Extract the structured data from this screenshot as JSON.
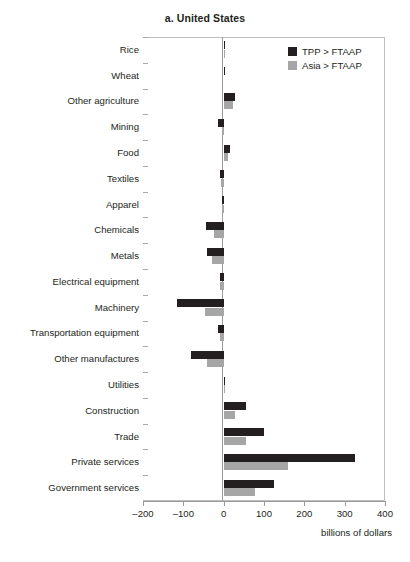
{
  "chart_data": {
    "type": "bar",
    "orientation": "horizontal",
    "title": "a. United States",
    "xlabel": "billions of dollars",
    "ylabel": "",
    "xlim": [
      -200,
      400
    ],
    "xticks": [
      -200,
      -100,
      0,
      100,
      200,
      300,
      400
    ],
    "xtick_labels": [
      "–200",
      "–100",
      "0",
      "100",
      "200",
      "300",
      "400"
    ],
    "grid": false,
    "legend_position": "top-right",
    "categories": [
      "Rice",
      "Wheat",
      "Other agriculture",
      "Mining",
      "Food",
      "Textiles",
      "Apparel",
      "Chemicals",
      "Metals",
      "Electrical equipment",
      "Machinery",
      "Transportation equipment",
      "Other manufactures",
      "Utilities",
      "Construction",
      "Trade",
      "Private services",
      "Government services"
    ],
    "series": [
      {
        "name": "TPP > FTAAP",
        "color": "#231f20",
        "values": [
          2,
          1,
          28,
          -13,
          16,
          -8,
          -5,
          -45,
          -42,
          -10,
          -115,
          -15,
          -80,
          2,
          55,
          100,
          325,
          125
        ]
      },
      {
        "name": "Asia > FTAAP",
        "color": "#a6a6a6",
        "values": [
          1,
          0,
          22,
          -5,
          10,
          -6,
          -4,
          -25,
          -28,
          -8,
          -47,
          -10,
          -42,
          1,
          28,
          55,
          160,
          78
        ]
      }
    ]
  }
}
